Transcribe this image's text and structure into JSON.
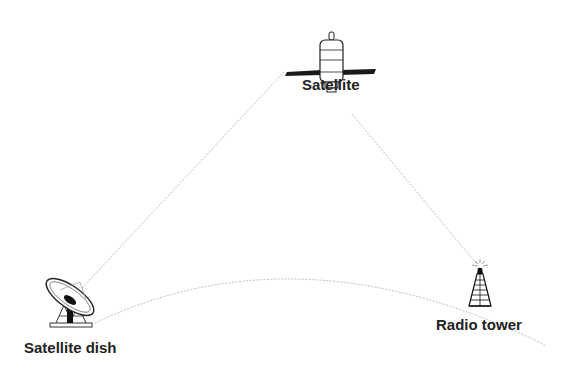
{
  "nodes": {
    "satellite": {
      "label": "Satellite",
      "icon": "satellite-icon"
    },
    "dish": {
      "label": "Satellite dish",
      "icon": "satellite-dish-icon"
    },
    "tower": {
      "label": "Radio tower",
      "icon": "radio-tower-icon"
    }
  },
  "links": [
    {
      "from": "dish",
      "to": "satellite",
      "style": "dotted"
    },
    {
      "from": "satellite",
      "to": "tower",
      "style": "dotted"
    },
    {
      "from": "dish",
      "to": "tower",
      "style": "curved-dotted"
    }
  ],
  "colors": {
    "line": "#bbbbbb",
    "icon": "#1a1a1a",
    "text": "#222222"
  }
}
